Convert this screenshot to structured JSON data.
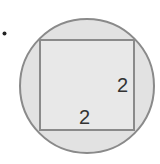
{
  "diagram": {
    "bullet": "•",
    "shapes": {
      "circle": {
        "fill": "#e2e2e2",
        "stroke": "#8a8a8a"
      },
      "square": {
        "fill": "#e8e8e8",
        "stroke": "#8a8a8a"
      }
    },
    "labels": {
      "side_right": "2",
      "side_bottom": "2"
    }
  }
}
